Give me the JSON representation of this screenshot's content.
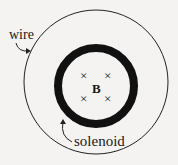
{
  "diagram": {
    "labels": {
      "wire": "wire",
      "solenoid": "solenoid",
      "field": "B"
    },
    "field_markers": [
      "×",
      "×",
      "×",
      "×"
    ],
    "colors": {
      "background": "#f4f3f1",
      "ink": "#111111"
    }
  }
}
